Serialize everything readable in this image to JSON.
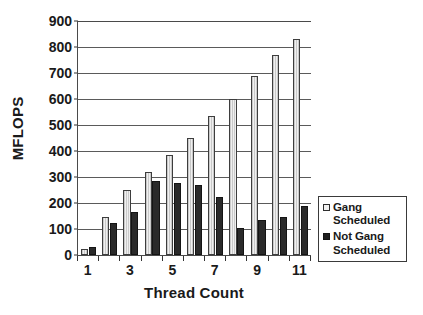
{
  "chart_data": {
    "type": "bar",
    "title": "",
    "xlabel": "Thread Count",
    "ylabel": "MFLOPS",
    "categories": [
      "1",
      "2",
      "3",
      "4",
      "5",
      "6",
      "7",
      "8",
      "9",
      "10",
      "11"
    ],
    "visible_tick_labels": [
      "1",
      "3",
      "5",
      "7",
      "9",
      "11"
    ],
    "ylim": [
      0,
      900
    ],
    "ytick_values": [
      0,
      100,
      200,
      300,
      400,
      500,
      600,
      700,
      800,
      900
    ],
    "ytick_labels": [
      "0",
      "100",
      "200",
      "300",
      "400",
      "500",
      "600",
      "700",
      "800",
      "900"
    ],
    "grid": true,
    "grid_axis": "y",
    "legend_position": "right",
    "series": [
      {
        "name": "Gang Scheduled",
        "label_lines": [
          "Gang",
          "Scheduled"
        ],
        "color": "#dcdcdc",
        "values": [
          25,
          145,
          250,
          320,
          385,
          450,
          535,
          600,
          690,
          770,
          830
        ]
      },
      {
        "name": "Not Gang Scheduled",
        "label_lines": [
          "Not Gang",
          "Scheduled"
        ],
        "color": "#2a2a2a",
        "values": [
          30,
          125,
          165,
          285,
          278,
          268,
          222,
          105,
          135,
          145,
          190
        ]
      }
    ]
  },
  "axes": {
    "y_title": "MFLOPS",
    "x_title": "Thread Count"
  },
  "legend": {
    "entries": [
      {
        "line1": "Gang",
        "line2": "Scheduled",
        "swatch": "light-square-icon"
      },
      {
        "line1": "Not Gang",
        "line2": "Scheduled",
        "swatch": "dark-square-icon"
      }
    ]
  },
  "colors": {
    "bar_light": "#dcdcdc",
    "bar_dark": "#2a2a2a",
    "axis": "#4a4a4a",
    "grid": "#5a5a5a",
    "text": "#1a1a1a",
    "background": "#ffffff"
  }
}
